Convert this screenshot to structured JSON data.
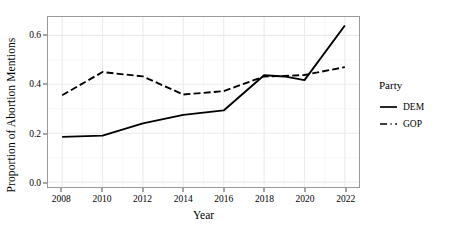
{
  "chart_data": {
    "type": "line",
    "title": "",
    "xlabel": "Year",
    "ylabel": "Proportion of Abortion Mentions",
    "xlim": [
      2007.3,
      2022.7
    ],
    "ylim": [
      -0.02,
      0.675
    ],
    "grid": true,
    "x_ticks": [
      2008,
      2010,
      2012,
      2014,
      2016,
      2018,
      2020,
      2022
    ],
    "x_tick_labels": [
      "2008",
      "2010",
      "2012",
      "2014",
      "2016",
      "2018",
      "2020",
      "2022"
    ],
    "x_minor_ticks": [
      2009,
      2011,
      2013,
      2015,
      2017,
      2019,
      2021
    ],
    "y_ticks": [
      0.0,
      0.2,
      0.4,
      0.6
    ],
    "y_tick_labels": [
      "0.0",
      "0.2",
      "0.4",
      "0.6"
    ],
    "y_minor_ticks": [
      0.1,
      0.3,
      0.5
    ],
    "legend": {
      "title": "Party",
      "position": "right",
      "entries": [
        {
          "name": "DEM",
          "style": "solid"
        },
        {
          "name": "GOP",
          "style": "dashed"
        }
      ]
    },
    "series": [
      {
        "name": "DEM",
        "style": "solid",
        "color": "#000000",
        "x": [
          2008,
          2010,
          2012,
          2014,
          2016,
          2018,
          2019,
          2020,
          2022
        ],
        "values": [
          0.185,
          0.19,
          0.24,
          0.275,
          0.293,
          0.437,
          0.432,
          0.417,
          0.64
        ]
      },
      {
        "name": "GOP",
        "style": "dashed",
        "color": "#000000",
        "x": [
          2008,
          2010,
          2012,
          2014,
          2016,
          2018,
          2019,
          2020,
          2022
        ],
        "values": [
          0.355,
          0.45,
          0.432,
          0.358,
          0.372,
          0.432,
          0.434,
          0.438,
          0.47
        ]
      }
    ]
  },
  "axes": {
    "x_title": "Year",
    "y_title": "Proportion of Abortion Mentions"
  },
  "legend": {
    "title": "Party",
    "items": [
      {
        "label": "DEM"
      },
      {
        "label": "GOP"
      }
    ]
  },
  "style": {
    "panel_border_color": "#9a9a9a",
    "grid_major_color": "#ebebeb",
    "grid_minor_color": "#f5f5f5",
    "line_color": "#000000",
    "text_color": "#000000",
    "background": "#ffffff"
  }
}
